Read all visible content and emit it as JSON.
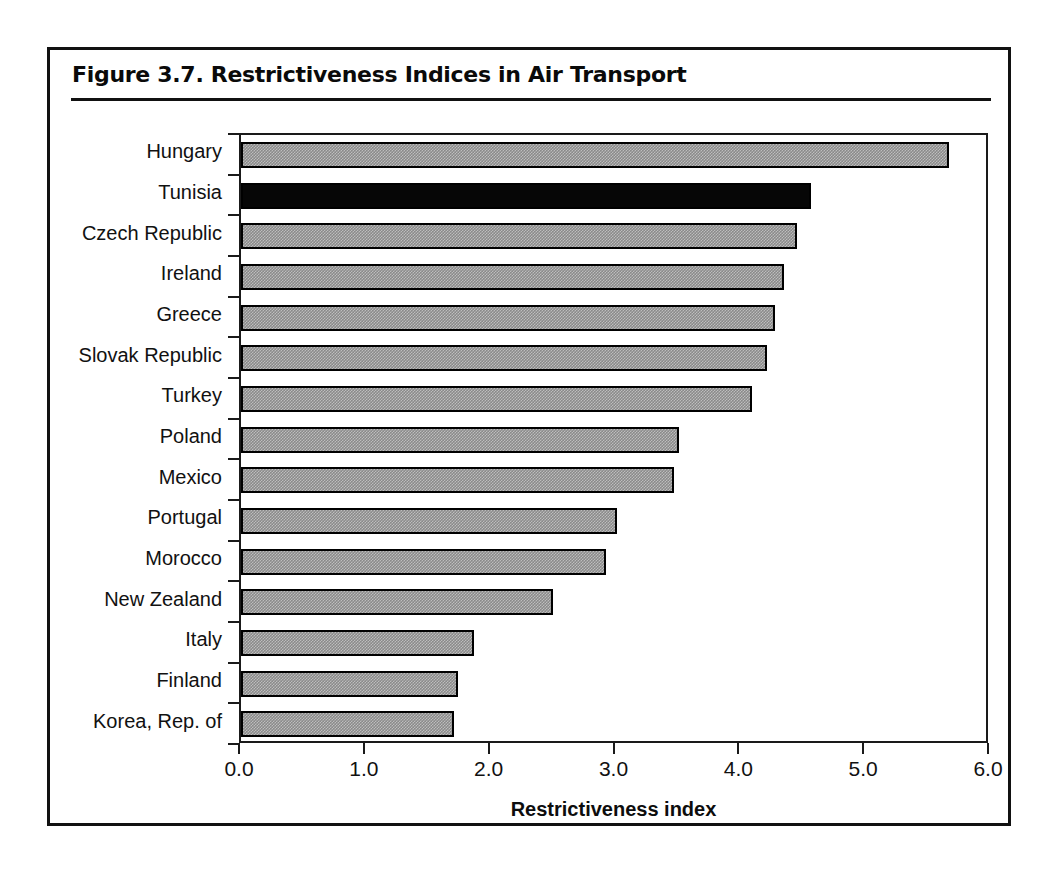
{
  "figure": {
    "title": "Figure 3.7.  Restrictiveness Indices in Air Transport"
  },
  "chart_data": {
    "type": "bar",
    "orientation": "horizontal",
    "title": "Figure 3.7.  Restrictiveness Indices in Air Transport",
    "xlabel": "Restrictiveness index",
    "ylabel": "",
    "xlim": [
      0.0,
      6.0
    ],
    "xticks": [
      "0.0",
      "1.0",
      "2.0",
      "3.0",
      "4.0",
      "5.0",
      "6.0"
    ],
    "xtick_values": [
      0.0,
      1.0,
      2.0,
      3.0,
      4.0,
      5.0,
      6.0
    ],
    "grid": false,
    "legend": false,
    "categories": [
      "Hungary",
      "Tunisia",
      "Czech Republic",
      "Ireland",
      "Greece",
      "Slovak Republic",
      "Turkey",
      "Poland",
      "Mexico",
      "Portugal",
      "Morocco",
      "New Zealand",
      "Italy",
      "Finland",
      "Korea, Rep. of"
    ],
    "values": [
      5.67,
      4.57,
      4.45,
      4.35,
      4.28,
      4.21,
      4.09,
      3.51,
      3.47,
      3.01,
      2.92,
      2.5,
      1.87,
      1.74,
      1.71
    ],
    "bar_styles": [
      "gray",
      "black",
      "gray",
      "gray",
      "gray",
      "gray",
      "gray",
      "gray",
      "gray",
      "gray",
      "gray",
      "gray",
      "gray",
      "gray",
      "gray"
    ],
    "colors": {
      "gray_bar": "#8a8a8a",
      "black_bar": "#060606",
      "bar_border": "#000000",
      "axis": "#1a1a1a",
      "frame": "#111111",
      "background": "#ffffff"
    }
  }
}
